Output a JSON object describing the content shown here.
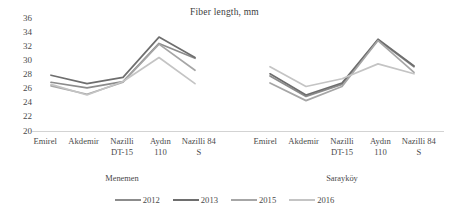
{
  "chart_data": {
    "type": "line",
    "title": "Fiber length, mm",
    "xlabel": "",
    "ylabel": "",
    "ylim": [
      20,
      36
    ],
    "ytick_step": 2,
    "yticks": [
      36,
      34,
      32,
      30,
      28,
      26,
      24,
      22,
      20
    ],
    "grid": false,
    "legend_position": "bottom",
    "panels": [
      {
        "name": "Menemen",
        "categories": [
          "Emirel",
          "Akdemir",
          "Nazilli DT-15",
          "Aydın 110",
          "Nazilli 84 S"
        ],
        "series": [
          {
            "name": "2012",
            "color": "#8c8c8c",
            "values": [
              26.9,
              26.1,
              27.0,
              32.4,
              30.3
            ]
          },
          {
            "name": "2013",
            "color": "#6e6e6e",
            "values": [
              27.9,
              26.7,
              27.6,
              33.3,
              30.4
            ]
          },
          {
            "name": "2015",
            "color": "#a6a6a6",
            "values": [
              26.4,
              25.2,
              26.9,
              32.3,
              28.6
            ]
          },
          {
            "name": "2016",
            "color": "#c4c4c4",
            "values": [
              26.6,
              25.1,
              27.0,
              30.4,
              26.7
            ]
          }
        ]
      },
      {
        "name": "Sarayköy",
        "categories": [
          "Emirel",
          "Akdemir",
          "Nazilli DT-15",
          "Aydın 110",
          "Nazilli 84 S"
        ],
        "series": [
          {
            "name": "2012",
            "color": "#8c8c8c",
            "values": [
              27.8,
              24.9,
              26.6,
              32.9,
              29.1
            ]
          },
          {
            "name": "2013",
            "color": "#6e6e6e",
            "values": [
              28.1,
              25.1,
              26.8,
              33.0,
              29.2
            ]
          },
          {
            "name": "2015",
            "color": "#a6a6a6",
            "values": [
              26.8,
              24.3,
              26.3,
              32.8,
              28.3
            ]
          },
          {
            "name": "2016",
            "color": "#c4c4c4",
            "values": [
              29.1,
              26.3,
              27.4,
              29.5,
              28.1
            ]
          }
        ]
      }
    ],
    "legend": [
      {
        "label": "2012",
        "color": "#8c8c8c"
      },
      {
        "label": "2013",
        "color": "#6e6e6e"
      },
      {
        "label": "2015",
        "color": "#a6a6a6"
      },
      {
        "label": "2016",
        "color": "#c4c4c4"
      }
    ],
    "axis_color": "#d3d3d3"
  }
}
